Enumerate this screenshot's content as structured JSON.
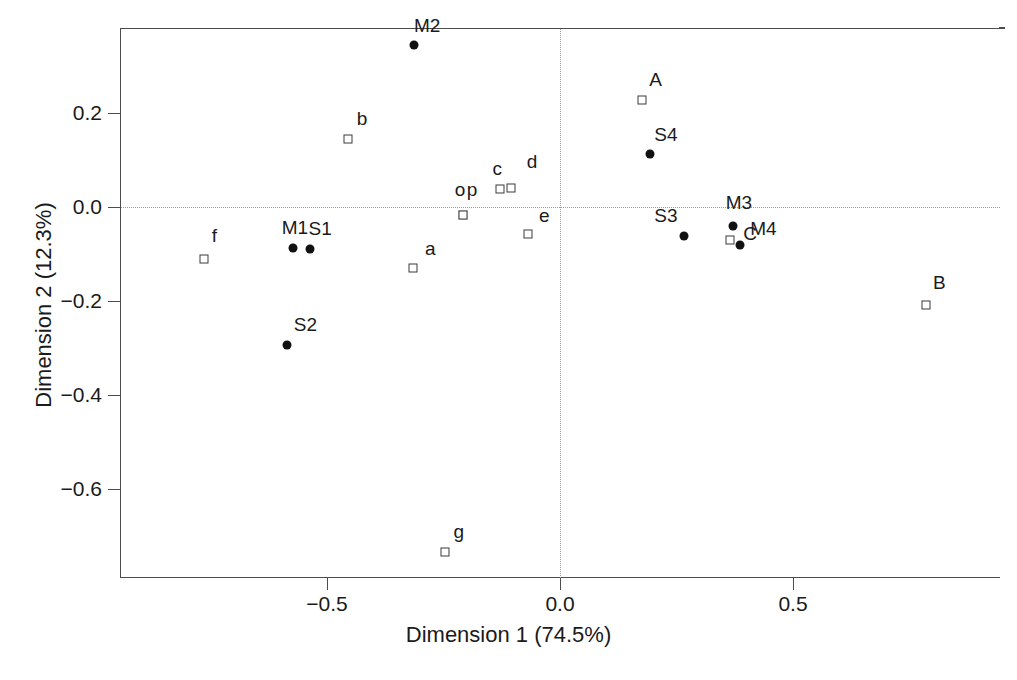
{
  "chart_data": {
    "type": "scatter",
    "title": "",
    "xlabel": "Dimension 1 (74.5%)",
    "ylabel": "Dimension 2 (12.3%)",
    "xlim": [
      -0.86,
      0.93
    ],
    "ylim": [
      -0.78,
      0.38
    ],
    "xticks": [
      "-0.5",
      "0.0",
      "0.5"
    ],
    "xtick_values": [
      -0.5,
      0.0,
      0.5
    ],
    "yticks": [
      "0.2",
      "0.0",
      "-0.2",
      "-0.4",
      "-0.6"
    ],
    "ytick_values": [
      0.2,
      0.0,
      -0.2,
      -0.4,
      -0.6
    ],
    "grid": false,
    "zero_reference_lines": true,
    "legend": "none",
    "series": [
      {
        "name": "rows",
        "marker": "filled-circle",
        "points": [
          {
            "label": "M2",
            "x": -0.313,
            "y": 0.345,
            "label_dx": 13,
            "label_dy": -19
          },
          {
            "label": "S4",
            "x": 0.193,
            "y": 0.113,
            "label_dx": 16,
            "label_dy": -19
          },
          {
            "label": "M1",
            "x": -0.573,
            "y": -0.088,
            "label_dx": 2,
            "label_dy": -20
          },
          {
            "label": "S1",
            "x": -0.536,
            "y": -0.089,
            "label_dx": 10,
            "label_dy": -20
          },
          {
            "label": "S2",
            "x": -0.585,
            "y": -0.294,
            "label_dx": 18,
            "label_dy": -20
          },
          {
            "label": "S3",
            "x": 0.266,
            "y": -0.062,
            "label_dx": -18,
            "label_dy": -20
          },
          {
            "label": "M3",
            "x": 0.371,
            "y": -0.041,
            "label_dx": 6,
            "label_dy": -23
          },
          {
            "label": "M4",
            "x": 0.387,
            "y": -0.08,
            "label_dx": 23,
            "label_dy": -16
          }
        ]
      },
      {
        "name": "columns",
        "marker": "open-square",
        "points": [
          {
            "label": "A",
            "x": 0.175,
            "y": 0.227,
            "label_dx": 14,
            "label_dy": -20
          },
          {
            "label": "B",
            "x": 0.786,
            "y": -0.208,
            "label_dx": 13,
            "label_dy": -22
          },
          {
            "label": "C",
            "x": 0.365,
            "y": -0.07,
            "label_dx": 20,
            "label_dy": -6
          },
          {
            "label": "a",
            "x": -0.315,
            "y": -0.13,
            "label_dx": 17,
            "label_dy": -19
          },
          {
            "label": "b",
            "x": -0.455,
            "y": 0.145,
            "label_dx": 14,
            "label_dy": -20
          },
          {
            "label": "c",
            "x": -0.128,
            "y": 0.038,
            "label_dx": -3,
            "label_dy": -20
          },
          {
            "label": "d",
            "x": -0.105,
            "y": 0.04,
            "label_dx": 21,
            "label_dy": -26
          },
          {
            "label": "e",
            "x": -0.068,
            "y": -0.058,
            "label_dx": 16,
            "label_dy": -18
          },
          {
            "label": "f",
            "x": -0.763,
            "y": -0.11,
            "label_dx": 10,
            "label_dy": -23
          },
          {
            "label": "g",
            "x": -0.247,
            "y": -0.733,
            "label_dx": 14,
            "label_dy": -20
          },
          {
            "label": "o",
            "x": -0.208,
            "y": -0.018,
            "label_dx": -3,
            "label_dy": -25
          },
          {
            "label": "p",
            "x": -0.208,
            "y": -0.018,
            "label_dx": 9,
            "label_dy": -25
          }
        ]
      }
    ]
  }
}
